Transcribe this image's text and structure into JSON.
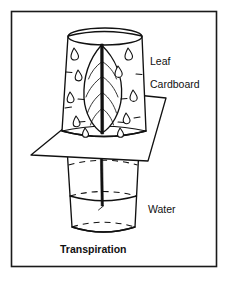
{
  "figure": {
    "title": "Transpiration",
    "caption": "Transpiration",
    "kind": "line-diagram",
    "border_color": "#1a1a1a",
    "ink_color": "#111111",
    "background_color": "#ffffff"
  },
  "labels": {
    "leaf": "Leaf",
    "cardboard": "Cardboard",
    "water": "Water"
  },
  "parts": {
    "jar": "inverted-glass-jar",
    "droplets": "condensation-droplets",
    "leaf": "leaf-with-veins",
    "card": "cardboard-sheet",
    "beaker": "water-beaker",
    "waterline": "water-surface-line",
    "stem": "plant-stem"
  }
}
